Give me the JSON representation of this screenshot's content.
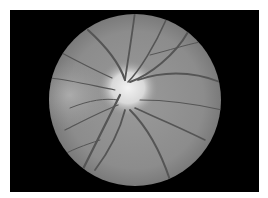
{
  "image": {
    "subject": "retinal fundus photograph",
    "colors": {
      "background": "#ffffff",
      "frame": "#000000",
      "retina": "#8a8a8a",
      "optic_disc": "#e6e6e6",
      "vessels": "#4a4a4a"
    }
  }
}
